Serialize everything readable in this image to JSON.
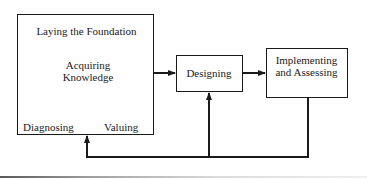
{
  "diagram": {
    "type": "flowchart",
    "nodes": {
      "foundation": {
        "title": "Laying the Foundation",
        "inner": {
          "top": "Acquiring Knowledge",
          "left": "Diagnosing",
          "right": "Valuing"
        }
      },
      "designing": {
        "label": "Designing"
      },
      "implementing": {
        "label": "Implementing and Assessing"
      }
    },
    "edges": [
      {
        "from": "Laying the Foundation",
        "to": "Designing",
        "style": "arrow"
      },
      {
        "from": "Designing",
        "to": "Implementing and Assessing",
        "style": "arrow"
      },
      {
        "from": "Implementing and Assessing",
        "to": "Designing",
        "style": "feedback-arrow"
      },
      {
        "from": "Implementing and Assessing",
        "to": "Laying the Foundation",
        "style": "feedback-arrow"
      }
    ],
    "inner_edges": [
      {
        "from": "Acquiring Knowledge",
        "to": "Diagnosing",
        "style": "line"
      },
      {
        "from": "Acquiring Knowledge",
        "to": "Valuing",
        "style": "line"
      },
      {
        "from": "Diagnosing",
        "to": "Valuing",
        "style": "line"
      }
    ],
    "colors": {
      "stroke": "#1a1a1a",
      "background": "#ffffff"
    }
  }
}
